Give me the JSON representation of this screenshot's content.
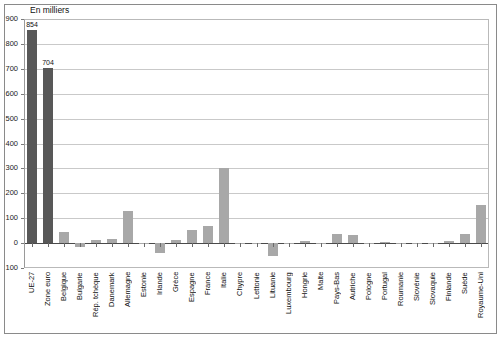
{
  "chart": {
    "unit_label": "En milliers",
    "frame_color": "#8a8a8a",
    "grid_color": "#c9c9c9",
    "bar_color_highlight": "#585858",
    "bar_color_default": "#a8a8a8"
  },
  "chart_data": {
    "type": "bar",
    "title": "",
    "subtitle": "",
    "xlabel": "",
    "ylabel": "En milliers",
    "ylim": [
      -100,
      900
    ],
    "ytick_step": 100,
    "yticks": [
      900,
      800,
      700,
      600,
      500,
      400,
      300,
      200,
      100,
      0,
      -100
    ],
    "ytick_labels": [
      "900",
      "800",
      "700",
      "600",
      "500",
      "400",
      "300",
      "200",
      "100",
      "0",
      "100"
    ],
    "grid": true,
    "legend": "none",
    "categories": [
      "UE-27",
      "Zone euro",
      "Belgique",
      "Bulgarie",
      "Rép. tchèque",
      "Danemark",
      "Allemagne",
      "Estonie",
      "Irlande",
      "Grèce",
      "Espagne",
      "France",
      "Italie",
      "Chypre",
      "Lettonie",
      "Lituanie",
      "Luxembourg",
      "Hongrie",
      "Malte",
      "Pays-Bas",
      "Autriche",
      "Pologne",
      "Portugal",
      "Roumanie",
      "Slovénie",
      "Slovaquie",
      "Finlande",
      "Suède",
      "Royaume-Uni"
    ],
    "values": [
      854,
      704,
      45,
      -16,
      12,
      18,
      128,
      -3,
      -38,
      12,
      52,
      68,
      303,
      -2,
      -4,
      -52,
      2,
      10,
      1,
      38,
      33,
      1,
      3,
      1,
      1,
      1,
      8,
      38,
      155
    ],
    "data_labels": {
      "UE-27": "854",
      "Zone euro": "704"
    },
    "highlighted": [
      "UE-27",
      "Zone euro"
    ]
  }
}
